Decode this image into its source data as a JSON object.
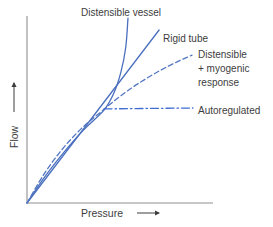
{
  "figure": {
    "description_visible_text_only": true,
    "axes": {
      "x_label": "Pressure",
      "y_label": "Flow",
      "axis_color": "#909090",
      "arrow_color": "#3d3d3d"
    },
    "text_color": "#3d3d3d"
  },
  "chart_data": {
    "type": "line",
    "title": "",
    "xlabel": "Pressure",
    "ylabel": "Flow",
    "axis_note": "qualitative axes, no numeric ticks; point coordinates normalized 0-1 of plot area",
    "grid": false,
    "legend_position": "labels at line ends",
    "series": [
      {
        "id": "distensible-vessel",
        "name": "Distensible vessel",
        "style": "solid",
        "color": "#4a6fbe",
        "points": [
          [
            0,
            0
          ],
          [
            0.096,
            0.141
          ],
          [
            0.198,
            0.271
          ],
          [
            0.303,
            0.39
          ],
          [
            0.414,
            0.497
          ],
          [
            0.467,
            0.588
          ],
          [
            0.505,
            0.7
          ],
          [
            0.531,
            0.834
          ],
          [
            0.543,
            0.989
          ]
        ]
      },
      {
        "id": "rigid-tube",
        "name": "Rigid tube",
        "style": "solid",
        "color": "#4a6fbe",
        "points": [
          [
            0,
            0
          ],
          [
            0.71,
            0.925
          ]
        ]
      },
      {
        "id": "distensible-myogenic",
        "name": "Distensible + myogenic response",
        "label_lines": [
          "Distensible",
          "+ myogenic",
          "response"
        ],
        "style": "dashed",
        "color": "#5377c2",
        "points": [
          [
            0,
            0
          ],
          [
            0.088,
            0.149
          ],
          [
            0.184,
            0.281
          ],
          [
            0.289,
            0.395
          ],
          [
            0.403,
            0.492
          ],
          [
            0.514,
            0.581
          ],
          [
            0.632,
            0.66
          ],
          [
            0.756,
            0.73
          ],
          [
            0.887,
            0.791
          ]
        ]
      },
      {
        "id": "autoregulated",
        "name": "Autoregulated",
        "style": "dashdot",
        "color": "#3f6dd0",
        "points": [
          [
            0.414,
            0.503
          ],
          [
            0.892,
            0.508
          ]
        ]
      }
    ]
  }
}
